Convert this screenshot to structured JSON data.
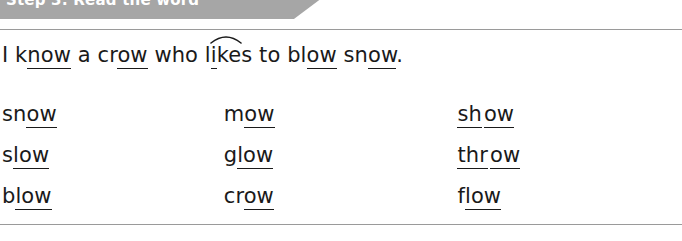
{
  "banner": {
    "label": "Step 3: Read the word",
    "color": "#a6a6a6",
    "text_color": "#ffffff"
  },
  "panel": {
    "border_color": "#9a9a9a",
    "background": "#ffffff"
  },
  "sentence": {
    "full_text": "I know a crow who likes to blow snow.",
    "parts": {
      "p1": "I k",
      "p2": "now",
      "p3": " a cr",
      "p4": "ow",
      "p5": " who l",
      "p6": "i",
      "p7": "ke",
      "p8": "s to bl",
      "p9": "ow",
      "p10": " sn",
      "p11": "ow",
      "p12": "."
    },
    "marks": {
      "arc_over": "ike",
      "underlined_digraph": "ow"
    }
  },
  "word_columns": [
    {
      "name": "column-1",
      "words": [
        {
          "text": "snow",
          "plain": "sn",
          "underlined": "ow",
          "underlined2": "",
          "plain2": ""
        },
        {
          "text": "slow",
          "plain": "s",
          "underlined": "low",
          "underlined2": "",
          "plain2": ""
        },
        {
          "text": "blow",
          "plain": "b",
          "underlined": "low",
          "underlined2": "",
          "plain2": ""
        }
      ]
    },
    {
      "name": "column-2",
      "words": [
        {
          "text": "mow",
          "plain": "m",
          "underlined": "ow",
          "underlined2": "",
          "plain2": ""
        },
        {
          "text": "glow",
          "plain": "g",
          "underlined": "low",
          "underlined2": "",
          "plain2": ""
        },
        {
          "text": "crow",
          "plain": "cr",
          "underlined": "ow",
          "underlined2": "",
          "plain2": ""
        }
      ]
    },
    {
      "name": "column-3",
      "words": [
        {
          "text": "show",
          "plain": "",
          "underlined": "sh",
          "underlined2": "ow",
          "plain2": ""
        },
        {
          "text": "throw",
          "plain": "",
          "underlined": "thr",
          "underlined2": "ow",
          "plain2": ""
        },
        {
          "text": "flow",
          "plain": "f",
          "underlined": "low",
          "underlined2": "",
          "plain2": ""
        }
      ]
    }
  ],
  "text_color": "#1a1a1a"
}
